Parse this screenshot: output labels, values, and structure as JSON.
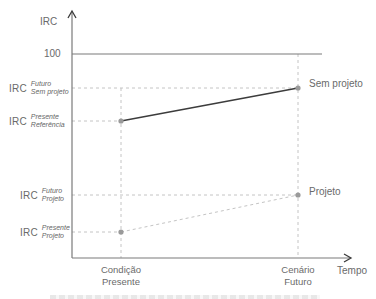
{
  "axes": {
    "y_label": "IRC",
    "x_label": "Tempo",
    "reference_line_label": "100"
  },
  "y_labels": [
    {
      "prefix": "IRC",
      "line1": "Futuro",
      "line2": "Sem projeto"
    },
    {
      "prefix": "IRC",
      "line1": "Presente",
      "line2": "Referência"
    },
    {
      "prefix": "IRC",
      "line1": "Futuro",
      "line2": "Projeto"
    },
    {
      "prefix": "IRC",
      "line1": "Presente",
      "line2": "Projeto"
    }
  ],
  "x_categories": [
    {
      "line1": "Condição",
      "line2": "Presente"
    },
    {
      "line1": "Cenário",
      "line2": "Futuro"
    }
  ],
  "series_labels": {
    "without_project": "Sem projeto",
    "with_project": "Projeto"
  },
  "colors": {
    "axis": "#7a7a7a",
    "solid_line": "#3c3c3c",
    "dashed": "#bdbdbd",
    "point": "#9a9a9a",
    "text": "#6a6a6a"
  }
}
